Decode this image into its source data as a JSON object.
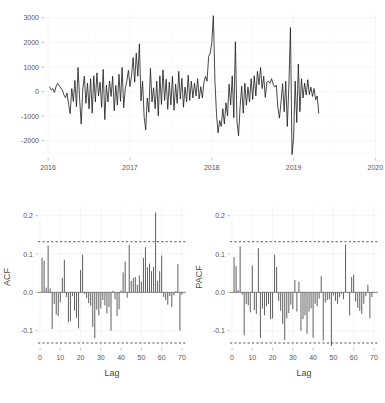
{
  "figure": {
    "name": "time-series-diagnostics-figure",
    "background_color": "#ffffff",
    "line_color": "#1a1a1a",
    "bar_color": "#4d4d4d",
    "confidence_line_color": "#2e2e2e",
    "grid_color": "#ececec"
  },
  "chart_data": [
    {
      "id": "timeseries",
      "type": "line",
      "title": "",
      "xlabel": "",
      "ylabel": "",
      "grid": true,
      "legend": "none",
      "xlim": [
        2015.95,
        2020.02
      ],
      "ylim": [
        -2700,
        3150
      ],
      "xticks": [
        2016,
        2017,
        2018,
        2019,
        2020
      ],
      "xtick_labels": [
        "2016",
        "2017",
        "2018",
        "2019",
        "2020"
      ],
      "yticks": [
        -2000,
        -1000,
        0,
        1000,
        2000,
        3000
      ],
      "ytick_labels": [
        "-2000",
        "-1000",
        "0",
        "1000",
        "2000",
        "3000"
      ],
      "x_start": 2016.02,
      "x_step": 0.019230769,
      "values": [
        180,
        60,
        120,
        -40,
        200,
        330,
        250,
        140,
        60,
        -130,
        -250,
        -60,
        -520,
        -900,
        120,
        -400,
        450,
        -620,
        980,
        -300,
        -1320,
        100,
        620,
        -480,
        340,
        -700,
        520,
        -880,
        640,
        -420,
        760,
        -180,
        380,
        -640,
        900,
        -1140,
        250,
        -420,
        430,
        -200,
        620,
        -780,
        250,
        -550,
        700,
        -400,
        980,
        -660,
        120,
        420,
        860,
        200,
        640,
        1380,
        380,
        1560,
        620,
        1940,
        -380,
        420,
        -1020,
        -1560,
        -260,
        -840,
        940,
        -420,
        150,
        -700,
        420,
        -980,
        640,
        -520,
        880,
        -360,
        500,
        -720,
        380,
        -540,
        620,
        -760,
        300,
        -480,
        820,
        -300,
        540,
        -640,
        180,
        -420,
        660,
        -360,
        420,
        -260,
        340,
        -180,
        520,
        -300,
        200,
        -260,
        380,
        620,
        420,
        1420,
        1560,
        1980,
        3080,
        420,
        -920,
        -1680,
        -1180,
        -1420,
        -700,
        -1320,
        -460,
        -980,
        300,
        -540,
        640,
        -1060,
        2020,
        -1220,
        -1800,
        -620,
        220,
        -880,
        340,
        -560,
        180,
        -420,
        520,
        -320,
        640,
        -180,
        820,
        280,
        980,
        120,
        620,
        -240,
        380,
        420,
        340,
        520,
        300,
        180,
        260,
        -640,
        -1080,
        -420,
        320,
        -820,
        420,
        -1420,
        260,
        2600,
        -2560,
        -1860,
        420,
        -1260,
        1120,
        -820,
        520,
        -260,
        340,
        -140,
        480,
        -120,
        180,
        -200,
        120,
        -340,
        -180,
        -880
      ]
    },
    {
      "id": "acf",
      "type": "bar",
      "title": "",
      "xlabel": "Lag",
      "ylabel": "ACF",
      "grid": true,
      "legend": "none",
      "xlim": [
        -1,
        72
      ],
      "ylim": [
        -0.145,
        0.225
      ],
      "xticks": [
        0,
        10,
        20,
        30,
        40,
        50,
        60,
        70
      ],
      "xtick_labels": [
        "0",
        "10",
        "20",
        "30",
        "40",
        "50",
        "60",
        "70"
      ],
      "yticks": [
        -0.1,
        0.0,
        0.1,
        0.2
      ],
      "ytick_labels": [
        "-0.1",
        "0.0",
        "0.1",
        "0.2"
      ],
      "confidence_bounds": [
        0.132,
        -0.132
      ],
      "lags": [
        1,
        2,
        3,
        4,
        5,
        6,
        7,
        8,
        9,
        10,
        11,
        12,
        13,
        14,
        15,
        16,
        17,
        18,
        19,
        20,
        21,
        22,
        23,
        24,
        25,
        26,
        27,
        28,
        29,
        30,
        31,
        32,
        33,
        34,
        35,
        36,
        37,
        38,
        39,
        40,
        41,
        42,
        43,
        44,
        45,
        46,
        47,
        48,
        49,
        50,
        51,
        52,
        53,
        54,
        55,
        56,
        57,
        58,
        59,
        60,
        61,
        62,
        63,
        64,
        65,
        66,
        67,
        68,
        69,
        70
      ],
      "values": [
        0.09,
        0.082,
        0.012,
        0.122,
        0.01,
        -0.096,
        -0.03,
        -0.058,
        -0.062,
        -0.026,
        0.038,
        0.085,
        -0.012,
        -0.078,
        -0.075,
        -0.01,
        -0.048,
        -0.066,
        -0.094,
        0.058,
        0.098,
        -0.004,
        -0.015,
        -0.028,
        -0.035,
        -0.09,
        -0.12,
        -0.045,
        -0.06,
        -0.042,
        -0.02,
        -0.034,
        -0.055,
        -0.038,
        -0.1,
        0.004,
        -0.018,
        -0.062,
        -0.044,
        0.005,
        0.052,
        0.08,
        -0.014,
        0.124,
        0.03,
        0.038,
        0.04,
        0.02,
        0.044,
        0.028,
        0.09,
        0.118,
        0.065,
        0.075,
        0.055,
        0.066,
        0.208,
        0.03,
        0.055,
        0.096,
        -0.012,
        -0.02,
        -0.032,
        -0.01,
        -0.038,
        -0.008,
        0.003,
        0.074,
        -0.1,
        -0.006
      ]
    },
    {
      "id": "pacf",
      "type": "bar",
      "title": "",
      "xlabel": "Lag",
      "ylabel": "PACF",
      "grid": true,
      "legend": "none",
      "xlim": [
        -1,
        72
      ],
      "ylim": [
        -0.145,
        0.225
      ],
      "xticks": [
        0,
        10,
        20,
        30,
        40,
        50,
        60,
        70
      ],
      "xtick_labels": [
        "0",
        "10",
        "20",
        "30",
        "40",
        "50",
        "60",
        "70"
      ],
      "yticks": [
        -0.1,
        0.0,
        0.1,
        0.2
      ],
      "ytick_labels": [
        "-0.1",
        "0.0",
        "0.1",
        "0.2"
      ],
      "confidence_bounds": [
        0.132,
        -0.132
      ],
      "lags": [
        1,
        2,
        3,
        4,
        5,
        6,
        7,
        8,
        9,
        10,
        11,
        12,
        13,
        14,
        15,
        16,
        17,
        18,
        19,
        20,
        21,
        22,
        23,
        24,
        25,
        26,
        27,
        28,
        29,
        30,
        31,
        32,
        33,
        34,
        35,
        36,
        37,
        38,
        39,
        40,
        41,
        42,
        43,
        44,
        45,
        46,
        47,
        48,
        49,
        50,
        51,
        52,
        53,
        54,
        55,
        56,
        57,
        58,
        59,
        60,
        61,
        62,
        63,
        64,
        65,
        66,
        67,
        68,
        69,
        70
      ],
      "values": [
        0.092,
        0.068,
        0.006,
        0.12,
        -0.006,
        -0.112,
        -0.03,
        -0.034,
        -0.052,
        0.07,
        -0.046,
        -0.056,
        0.115,
        -0.118,
        -0.042,
        -0.06,
        -0.036,
        -0.03,
        -0.07,
        -0.068,
        0.098,
        0.066,
        -0.022,
        -0.048,
        -0.082,
        -0.124,
        -0.068,
        -0.054,
        -0.032,
        -0.044,
        0.032,
        -0.05,
        0.028,
        -0.1,
        -0.07,
        -0.06,
        -0.108,
        -0.05,
        -0.042,
        -0.118,
        -0.03,
        -0.036,
        -0.016,
        0.042,
        -0.126,
        -0.026,
        -0.02,
        -0.018,
        -0.14,
        -0.008,
        -0.022,
        -0.03,
        -0.012,
        -0.004,
        -0.018,
        0.124,
        -0.002,
        -0.06,
        0.04,
        0.046,
        -0.024,
        -0.04,
        -0.048,
        -0.056,
        -0.03,
        -0.01,
        0.02,
        -0.068,
        -0.012,
        -0.002
      ]
    }
  ]
}
